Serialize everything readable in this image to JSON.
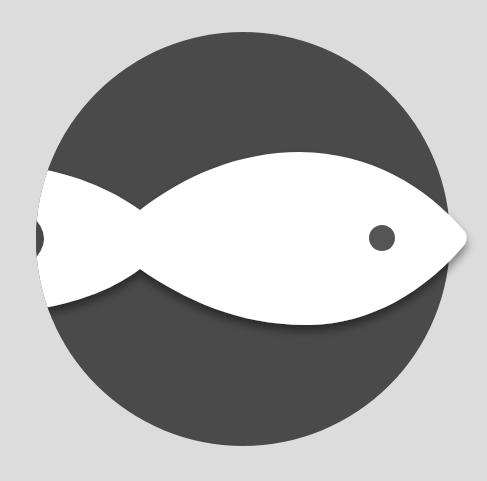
{
  "illustration": {
    "subject": "fish-in-circle-icon",
    "colors": {
      "background": "#dcdcdc",
      "circle": "#4a4a4a",
      "fish": "#ffffff",
      "eye": "#555555",
      "shadow": "#000000"
    },
    "circle": {
      "cx": 243,
      "cy": 239,
      "r": 207
    },
    "eye": {
      "cx": 382,
      "cy": 238,
      "r": 13
    }
  }
}
